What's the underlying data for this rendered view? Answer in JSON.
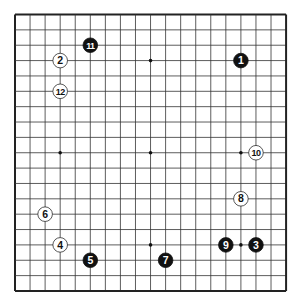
{
  "board": {
    "size": 19,
    "origin_x": 15,
    "origin_y": 14.5,
    "cell_w": 15.06,
    "cell_h": 15.36,
    "line_color": "#333333",
    "border_color": "#222222",
    "background": "#ffffff",
    "hoshi": [
      [
        3,
        3
      ],
      [
        9,
        3
      ],
      [
        15,
        3
      ],
      [
        3,
        9
      ],
      [
        9,
        9
      ],
      [
        15,
        9
      ],
      [
        3,
        15
      ],
      [
        9,
        15
      ],
      [
        15,
        15
      ]
    ]
  },
  "stones": [
    {
      "move": "1",
      "color": "black",
      "col": 15,
      "row": 3
    },
    {
      "move": "2",
      "color": "white",
      "col": 3,
      "row": 3
    },
    {
      "move": "3",
      "color": "black",
      "col": 16,
      "row": 15
    },
    {
      "move": "4",
      "color": "white",
      "col": 3,
      "row": 15
    },
    {
      "move": "5",
      "color": "black",
      "col": 5,
      "row": 16
    },
    {
      "move": "6",
      "color": "white",
      "col": 2,
      "row": 13
    },
    {
      "move": "7",
      "color": "black",
      "col": 10,
      "row": 16
    },
    {
      "move": "8",
      "color": "white",
      "col": 15,
      "row": 12
    },
    {
      "move": "9",
      "color": "black",
      "col": 14,
      "row": 15
    },
    {
      "move": "10",
      "color": "white",
      "col": 16,
      "row": 9
    },
    {
      "move": "11",
      "color": "black",
      "col": 5,
      "row": 2
    },
    {
      "move": "12",
      "color": "white",
      "col": 3,
      "row": 5
    }
  ]
}
